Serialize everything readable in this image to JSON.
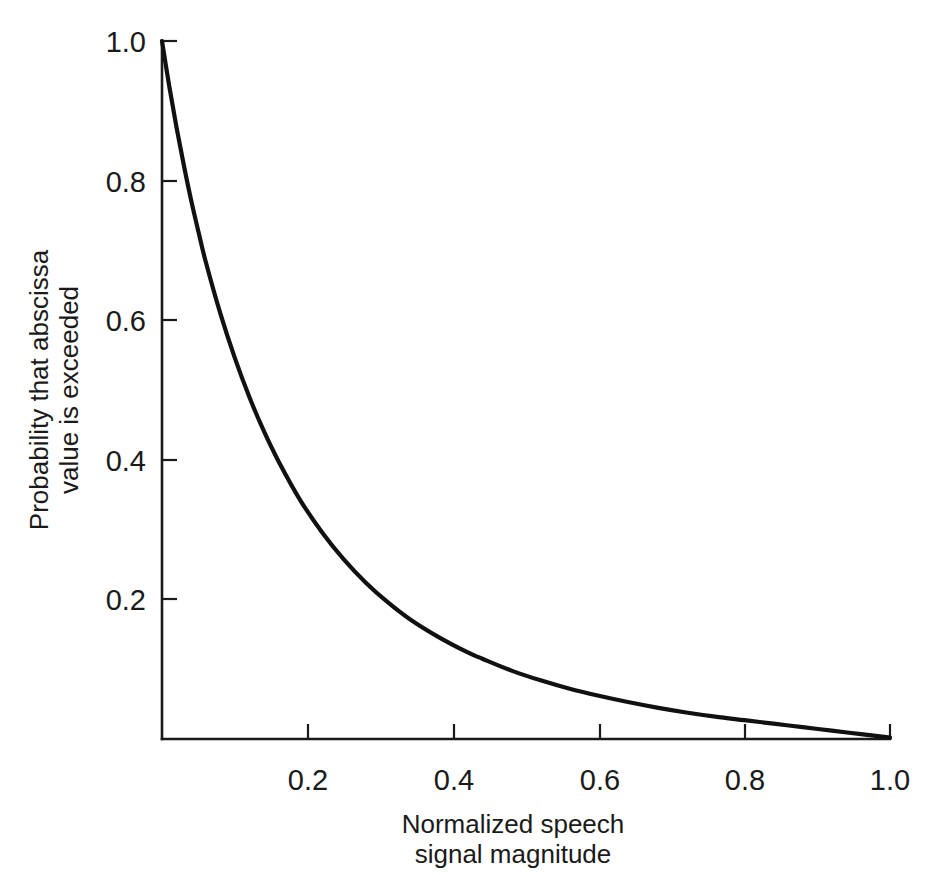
{
  "chart_data": {
    "type": "line",
    "title": "",
    "subtitle": "",
    "xlabel_line1": "Normalized speech",
    "xlabel_line2": "signal magnitude",
    "ylabel_line1": "Probability that abscissa",
    "ylabel_line2": "value is exceeded",
    "xlim": [
      0.0,
      1.0
    ],
    "ylim": [
      0.0,
      1.0
    ],
    "grid": false,
    "legend": false,
    "legend_position": "none",
    "x_ticks": [
      0.2,
      0.4,
      0.6,
      0.8,
      1.0
    ],
    "x_tick_labels": [
      "0.2",
      "0.4",
      "0.6",
      "0.8",
      "1.0"
    ],
    "y_ticks": [
      0.2,
      0.4,
      0.6,
      0.8,
      1.0
    ],
    "y_tick_labels": [
      "0.2",
      "0.4",
      "0.6",
      "0.8",
      "1.0"
    ],
    "series": [
      {
        "name": "exceedance probability",
        "color": "#111111",
        "x": [
          0.0,
          0.01,
          0.02,
          0.03,
          0.04,
          0.05,
          0.06,
          0.08,
          0.1,
          0.12,
          0.14,
          0.16,
          0.19,
          0.22,
          0.25,
          0.28,
          0.31,
          0.34,
          0.38,
          0.42,
          0.44,
          0.48,
          0.52,
          0.56,
          0.6,
          0.64,
          0.68,
          0.72,
          0.76,
          0.8,
          0.84,
          0.88,
          0.92,
          0.96,
          1.0
        ],
        "y": [
          1.0,
          0.935,
          0.876,
          0.822,
          0.772,
          0.727,
          0.684,
          0.61,
          0.546,
          0.49,
          0.441,
          0.398,
          0.342,
          0.296,
          0.257,
          0.224,
          0.196,
          0.172,
          0.146,
          0.124,
          0.115,
          0.098,
          0.084,
          0.072,
          0.062,
          0.053,
          0.045,
          0.038,
          0.032,
          0.027,
          0.022,
          0.017,
          0.012,
          0.007,
          0.002
        ]
      }
    ],
    "axis_color": "#1a1a1a",
    "background_color": "#ffffff"
  },
  "geometry": {
    "plot_left": 162,
    "plot_right": 890,
    "plot_top": 41,
    "plot_bottom": 739
  }
}
